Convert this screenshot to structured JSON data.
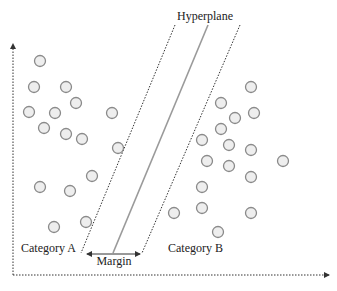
{
  "labels": {
    "hyperplane": "Hyperplane",
    "category_a": "Category A",
    "category_b": "Category B",
    "margin": "Margin"
  },
  "colors": {
    "point_stroke": "#8a8a8a",
    "point_fill": "#eeeeee",
    "axis": "#333333",
    "boundary": "#333333",
    "hyperplane": "#9a9a9a",
    "text": "#222222"
  },
  "category_a_points": [
    [
      40,
      61
    ],
    [
      34,
      87
    ],
    [
      66,
      87
    ],
    [
      76,
      103
    ],
    [
      29,
      112
    ],
    [
      55,
      113
    ],
    [
      112,
      113
    ],
    [
      44,
      128
    ],
    [
      66,
      134
    ],
    [
      82,
      139
    ],
    [
      118,
      148
    ],
    [
      40,
      187
    ],
    [
      92,
      176
    ],
    [
      70,
      191
    ],
    [
      54,
      227
    ],
    [
      86,
      222
    ]
  ],
  "category_b_points": [
    [
      251,
      87
    ],
    [
      221,
      103
    ],
    [
      254,
      113
    ],
    [
      235,
      118
    ],
    [
      221,
      129
    ],
    [
      202,
      140
    ],
    [
      229,
      145
    ],
    [
      251,
      150
    ],
    [
      207,
      161
    ],
    [
      229,
      166
    ],
    [
      283,
      161
    ],
    [
      251,
      177
    ],
    [
      202,
      187
    ],
    [
      202,
      208
    ],
    [
      174,
      213
    ],
    [
      251,
      213
    ],
    [
      218,
      232
    ]
  ]
}
